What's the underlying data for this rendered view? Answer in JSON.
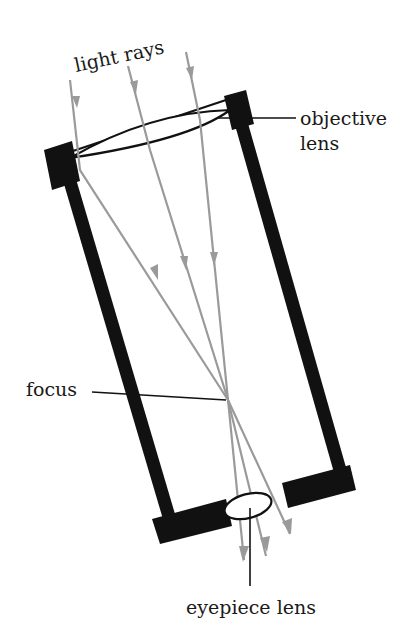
{
  "diagram": {
    "labels": {
      "light_rays": "light rays",
      "objective_lens_line1": "objective",
      "objective_lens_line2": "lens",
      "focus": "focus",
      "eyepiece_lens": "eyepiece lens"
    },
    "colors": {
      "tube": "#111111",
      "rays": "#9a9a9a",
      "text": "#1a1a1a",
      "background": "#ffffff"
    },
    "components": [
      "objective lens",
      "tube",
      "focus point",
      "eyepiece lens",
      "light rays (3)"
    ]
  }
}
